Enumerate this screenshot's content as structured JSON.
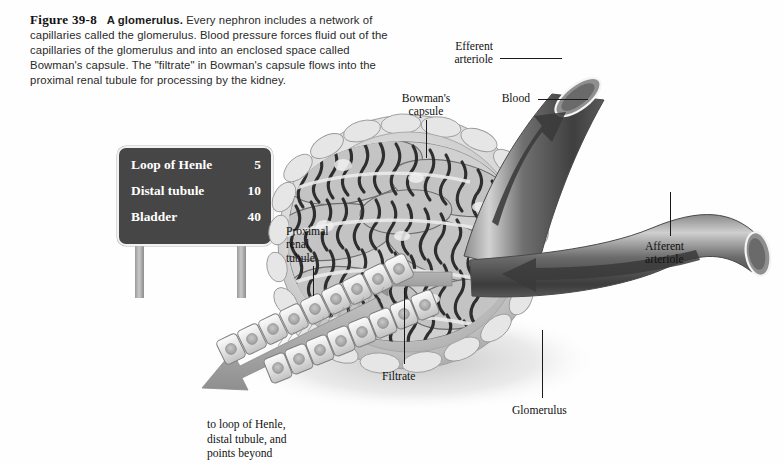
{
  "figure": {
    "number": "Figure 39-8",
    "title": "A glomerulus.",
    "body": "Every nephron includes a network of capillaries called the glomerulus. Blood pressure forces fluid out of the capillaries of the glomerulus and into an enclosed space called Bowman's capsule. The \"filtrate\" in Bowman's capsule flows into the proximal renal tubule for processing by the kidney."
  },
  "road_sign": {
    "rows": [
      {
        "label": "Loop of Henle",
        "value": "5"
      },
      {
        "label": "Distal tubule",
        "value": "10"
      },
      {
        "label": "Bladder",
        "value": "40"
      }
    ]
  },
  "labels": {
    "efferent_arteriole": "Efferent\narteriole",
    "blood": "Blood",
    "bowmans_capsule": "Bowman's\ncapsule",
    "afferent_arteriole": "Afferent\narteriole",
    "proximal_renal_tubule": "Proximal\nrenal\ntubule",
    "filtrate": "Filtrate",
    "glomerulus": "Glomerulus",
    "downstream": "to loop of Henle,\ndistal tubule, and\npoints beyond"
  },
  "colors": {
    "background": "#fefefe",
    "ink": "#111111",
    "sign_panel": "#464646",
    "sign_text": "#ffffff",
    "sign_border": "#f2f2f2",
    "vessel_dark": "#4e4e4e",
    "vessel_light": "#b9b9b9",
    "capsule": "#d9d9d9",
    "capillary": "#3a3a3a",
    "arrow_gray": "#9e9e9e"
  }
}
